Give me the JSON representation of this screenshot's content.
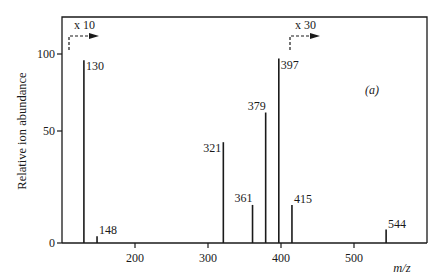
{
  "chart_data": {
    "type": "bar",
    "subtype": "mass-spectrum-stick",
    "panel_label": "(a)",
    "xlabel": "m/z",
    "ylabel": "Relative ion abundance",
    "x_ticks": [
      200,
      300,
      400,
      500
    ],
    "y_ticks": [
      0,
      50,
      100
    ],
    "grid": false,
    "legend": null,
    "annotations": [
      {
        "text": "x 10",
        "applies_from_mz": 110,
        "description": "intensity magnification arrow"
      },
      {
        "text": "x 30",
        "applies_from_mz": 397,
        "description": "intensity magnification arrow"
      }
    ],
    "peaks": [
      {
        "mz": 130,
        "label": "130",
        "abundance": 96
      },
      {
        "mz": 148,
        "label": "148",
        "abundance": 3
      },
      {
        "mz": 321,
        "label": "321",
        "abundance": 45
      },
      {
        "mz": 361,
        "label": "361",
        "abundance": 17
      },
      {
        "mz": 379,
        "label": "379",
        "abundance": 62
      },
      {
        "mz": 397,
        "label": "397",
        "abundance": 97
      },
      {
        "mz": 415,
        "label": "415",
        "abundance": 17
      },
      {
        "mz": 544,
        "label": "544",
        "abundance": 6
      }
    ],
    "categories": [
      "130",
      "148",
      "321",
      "361",
      "379",
      "397",
      "415",
      "544"
    ],
    "values": [
      96,
      3,
      45,
      17,
      62,
      97,
      17,
      6
    ]
  }
}
